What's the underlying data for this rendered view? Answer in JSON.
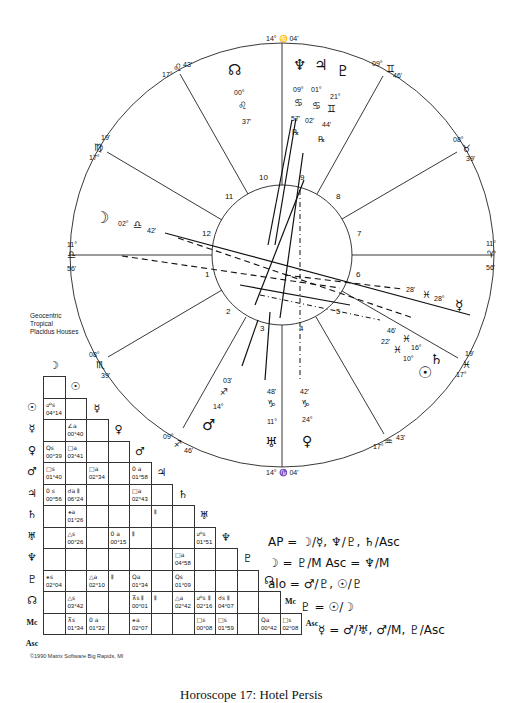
{
  "chart": {
    "system_info": [
      "Geocentric",
      "Tropical",
      "Placidus Houses"
    ],
    "copyright": "©1990 Matrix Software Big Rapids, MI",
    "caption": "Horoscope 17: Hotel Persis"
  },
  "cusps": [
    {
      "id": "mc",
      "deg": "14°",
      "sign": "♑",
      "min": "04'",
      "sign_name": "capricorn"
    },
    {
      "id": "11",
      "deg": "17°",
      "sign": "♌",
      "min": "43'",
      "sign_name": "leo"
    },
    {
      "id": "12",
      "deg": "17°",
      "sign": "♍",
      "min": "19'",
      "sign_name": "virgo"
    },
    {
      "id": "asc",
      "deg": "11°",
      "sign": "♎",
      "min": "56'",
      "sign_name": "libra"
    },
    {
      "id": "2",
      "deg": "08°",
      "sign": "♏",
      "min": "39'",
      "sign_name": "scorpio"
    },
    {
      "id": "3",
      "deg": "09°",
      "sign": "♐",
      "min": "46'",
      "sign_name": "sagittarius"
    },
    {
      "id": "ic",
      "deg": "14°",
      "sign": "♑",
      "min": "04'",
      "sign_name": "capricorn"
    },
    {
      "id": "5",
      "deg": "17°",
      "sign": "♒",
      "min": "43'",
      "sign_name": "aquarius"
    },
    {
      "id": "6",
      "deg": "17°",
      "sign": "♓",
      "min": "19'",
      "sign_name": "pisces"
    },
    {
      "id": "dsc",
      "deg": "11°",
      "sign": "♈",
      "min": "56'",
      "sign_name": "aries"
    },
    {
      "id": "8",
      "deg": "08°",
      "sign": "♉",
      "min": "39'",
      "sign_name": "taurus"
    },
    {
      "id": "9",
      "deg": "09°",
      "sign": "♊",
      "min": "46'",
      "sign_name": "gemini"
    }
  ],
  "mc_top": "14° ♋ 04'",
  "ic_bottom": "14° ♑ 04'",
  "house_numbers": [
    "1",
    "2",
    "3",
    "4",
    "5",
    "6",
    "7",
    "8",
    "9",
    "10",
    "11",
    "12"
  ],
  "planets": [
    {
      "name": "node",
      "glyph": "☊",
      "deg": "00°",
      "sign": "♌",
      "min": "37'"
    },
    {
      "name": "neptune",
      "glyph": "♆",
      "deg": "09°",
      "sign": "♋",
      "min": "57'",
      "retro": "℞"
    },
    {
      "name": "jupiter",
      "glyph": "♃",
      "deg": "01°",
      "sign": "♋",
      "min": "02'",
      "retro": "℞"
    },
    {
      "name": "pluto",
      "glyph": "♇",
      "deg": "21°",
      "sign": "♊",
      "min": "44'",
      "retro": "℞"
    },
    {
      "name": "moon",
      "glyph": "☽",
      "deg": "02°",
      "sign": "♎",
      "min": "42'"
    },
    {
      "name": "mercury",
      "glyph": "☿",
      "deg": "28°",
      "sign": "♓",
      "min": "28'"
    },
    {
      "name": "saturn",
      "glyph": "♄",
      "deg": "16°",
      "sign": "♓",
      "min": "46'"
    },
    {
      "name": "sun",
      "glyph": "☉",
      "deg": "10°",
      "sign": "♓",
      "min": "22'"
    },
    {
      "name": "mars",
      "glyph": "♂",
      "deg": "14°",
      "sign": "♐",
      "min": "03'"
    },
    {
      "name": "uranus",
      "glyph": "♅",
      "deg": "11°",
      "sign": "♑",
      "min": "48'"
    },
    {
      "name": "venus",
      "glyph": "♀",
      "deg": "24°",
      "sign": "♑",
      "min": "42'"
    }
  ],
  "aspect_grid": {
    "rows": [
      {
        "glyph": "☽",
        "name": "moon"
      },
      {
        "glyph": "☉",
        "name": "sun"
      },
      {
        "glyph": "☿",
        "name": "mercury"
      },
      {
        "glyph": "♀",
        "name": "venus"
      },
      {
        "glyph": "♂",
        "name": "mars"
      },
      {
        "glyph": "♃",
        "name": "jupiter"
      },
      {
        "glyph": "♄",
        "name": "saturn"
      },
      {
        "glyph": "♅",
        "name": "uranus"
      },
      {
        "glyph": "♆",
        "name": "neptune"
      },
      {
        "glyph": "♇",
        "name": "pluto"
      },
      {
        "glyph": "☊",
        "name": "node"
      },
      {
        "glyph": "Mc",
        "name": "mc",
        "text": true
      },
      {
        "glyph": "Asc",
        "name": "asc",
        "text": true
      }
    ],
    "cells": [
      {
        "r": 2,
        "c": 0,
        "asp": "☍s",
        "orb": "04°14"
      },
      {
        "r": 3,
        "c": 1,
        "asp": "∠a",
        "orb": "00°40"
      },
      {
        "r": 4,
        "c": 0,
        "asp": "Qs",
        "orb": "00°39"
      },
      {
        "r": 4,
        "c": 1,
        "asp": "□a",
        "orb": "03°41"
      },
      {
        "r": 5,
        "c": 0,
        "asp": "□s",
        "orb": "01°40"
      },
      {
        "r": 5,
        "c": 2,
        "asp": "□a",
        "orb": "02°34"
      },
      {
        "r": 5,
        "c": 4,
        "asp": "0 a",
        "orb": "01°58"
      },
      {
        "r": 6,
        "c": 0,
        "asp": "0 s",
        "orb": "00°56"
      },
      {
        "r": 6,
        "c": 1,
        "asp": "☌a ⫴",
        "orb": "06°24"
      },
      {
        "r": 6,
        "c": 4,
        "asp": "□a",
        "orb": "02°43"
      },
      {
        "r": 7,
        "c": 1,
        "asp": "⚹a",
        "orb": "01°26"
      },
      {
        "r": 7,
        "c": 5,
        "asp": "⫴",
        "orb": ""
      },
      {
        "r": 8,
        "c": 1,
        "asp": "△s",
        "orb": "00°26"
      },
      {
        "r": 8,
        "c": 3,
        "asp": "0 a",
        "orb": "00°15"
      },
      {
        "r": 8,
        "c": 4,
        "asp": "⫴",
        "orb": ""
      },
      {
        "r": 8,
        "c": 7,
        "asp": "☍s",
        "orb": "01°51"
      },
      {
        "r": 9,
        "c": 6,
        "asp": "□a",
        "orb": "04°58"
      },
      {
        "r": 10,
        "c": 0,
        "asp": "⚹s",
        "orb": "02°04"
      },
      {
        "r": 10,
        "c": 2,
        "asp": "△a",
        "orb": "02°10"
      },
      {
        "r": 10,
        "c": 3,
        "asp": "⫴",
        "orb": ""
      },
      {
        "r": 10,
        "c": 4,
        "asp": "Qa",
        "orb": "01°34"
      },
      {
        "r": 10,
        "c": 6,
        "asp": "Qs",
        "orb": "01°09"
      },
      {
        "r": 11,
        "c": 1,
        "asp": "△s",
        "orb": "03°42"
      },
      {
        "r": 11,
        "c": 4,
        "asp": "⊼s ⫴",
        "orb": "00°01"
      },
      {
        "r": 11,
        "c": 5,
        "asp": "⫴",
        "orb": ""
      },
      {
        "r": 11,
        "c": 6,
        "asp": "△a",
        "orb": "02°42"
      },
      {
        "r": 11,
        "c": 7,
        "asp": "☍s ⫴",
        "orb": "02°16"
      },
      {
        "r": 11,
        "c": 8,
        "asp": "☌s ⫴",
        "orb": "04°07"
      },
      {
        "r": 12,
        "c": 1,
        "asp": "⊼s",
        "orb": "01°34"
      },
      {
        "r": 12,
        "c": 2,
        "asp": "0 a",
        "orb": "01°32"
      },
      {
        "r": 12,
        "c": 4,
        "asp": "⚹a",
        "orb": "02°07"
      },
      {
        "r": 12,
        "c": 7,
        "asp": "□s",
        "orb": "00°08"
      },
      {
        "r": 12,
        "c": 8,
        "asp": "□s",
        "orb": "01°59"
      },
      {
        "r": 12,
        "c": 10,
        "asp": "Qa",
        "orb": "00°42"
      },
      {
        "r": 12,
        "c": 11,
        "asp": "□s",
        "orb": "02°08"
      }
    ]
  },
  "notes": [
    "AP = ☽/☿, ♆/♇, ♄/Asc",
    "☽ = ♇/M   Asc = ♆/M",
    "alo = ♂/♇, ☉/♇",
    "♇ = ☉/☽",
    "☿ = ♂/♅, ♂/M, ♇/Asc"
  ]
}
